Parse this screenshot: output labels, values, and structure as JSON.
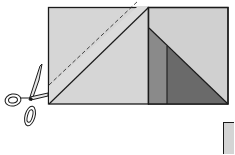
{
  "diagram": {
    "type": "sewing-illustration",
    "colors": {
      "background": "#ffffff",
      "light_fabric": "#d4d4d4",
      "medium_fabric": "#888888",
      "dark_fabric": "#6a6a6a",
      "outline": "#1a1a1a"
    },
    "elements": [
      {
        "name": "left-square",
        "note": "light square with diagonal seam and dashed cutting line"
      },
      {
        "name": "right-square",
        "note": "square with light upper triangle and dark lower triangle split by vertical seam"
      },
      {
        "name": "scissors-icon",
        "note": "scissors cutting along the line at left"
      },
      {
        "name": "partial-square",
        "note": "partially visible square at bottom-right"
      }
    ]
  }
}
